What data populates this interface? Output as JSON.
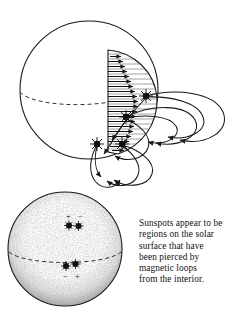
{
  "figure": {
    "title_alt": "Sunspots and magnetic loops on the Sun",
    "ink_color": "#1a1a1a",
    "background_color": "#ffffff",
    "stipple_color": "#777777"
  },
  "caption": {
    "lines": [
      "Sunspots appear to be",
      "regions on the solar",
      "surface that have",
      "been pierced by",
      "magnetic loops",
      "from the interior."
    ],
    "full_text": "Sunspots appear to be regions on the solar surface that have been pierced by magnetic loops from the interior."
  },
  "upper_sphere": {
    "label": "cutaway-sun-with-magnetic-field",
    "center": [
      89,
      90
    ],
    "radius": 69,
    "equator_style": "dashed",
    "wedge": {
      "label": "interior-cutaway-wedge",
      "hatching": "horizontal-lines",
      "arrow_count": 20,
      "arrow_direction": "outward-right",
      "meaning": "toroidal magnetic field inside the Sun"
    },
    "sunspots": [
      {
        "id": "spot-a",
        "x": 146,
        "y": 96
      },
      {
        "id": "spot-b",
        "x": 126,
        "y": 117
      },
      {
        "id": "spot-c",
        "x": 97,
        "y": 144
      },
      {
        "id": "spot-d",
        "x": 122,
        "y": 144
      }
    ],
    "loop_count": 8,
    "loop_label": "magnetic-field-loop"
  },
  "lower_sphere": {
    "label": "sun-surface-with-sunspot-pairs",
    "center": [
      65,
      249
    ],
    "radius": 57,
    "texture": "stippled",
    "equator_style": "dashed",
    "sunspot_pairs": [
      {
        "id": "northern-pair",
        "signs": [
          "+",
          "−"
        ],
        "sign_position": "above",
        "spots": [
          [
            69,
            225
          ],
          [
            78,
            226
          ]
        ],
        "sign_points": [
          [
            68,
            216
          ],
          [
            80,
            216
          ]
        ]
      },
      {
        "id": "southern-pair",
        "signs": [
          "−",
          "+"
        ],
        "sign_position": "below",
        "spots": [
          [
            66,
            266
          ],
          [
            75,
            264
          ]
        ],
        "sign_points": [
          [
            66,
            276
          ],
          [
            77,
            276
          ]
        ]
      }
    ]
  }
}
